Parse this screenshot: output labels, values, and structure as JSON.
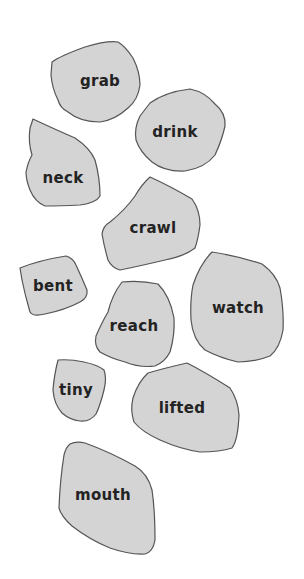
{
  "colors": {
    "background": "#ffffff",
    "shape_fill": "#d4d4d4",
    "shape_outline": "#555555",
    "text": "#232323"
  },
  "words": [
    {
      "label": "grab",
      "x": 100,
      "y": 81
    },
    {
      "label": "drink",
      "x": 175,
      "y": 132
    },
    {
      "label": "neck",
      "x": 63,
      "y": 178
    },
    {
      "label": "crawl",
      "x": 153,
      "y": 228
    },
    {
      "label": "bent",
      "x": 53,
      "y": 286
    },
    {
      "label": "reach",
      "x": 134,
      "y": 326
    },
    {
      "label": "watch",
      "x": 238,
      "y": 308
    },
    {
      "label": "tiny",
      "x": 76,
      "y": 390
    },
    {
      "label": "lifted",
      "x": 182,
      "y": 408
    },
    {
      "label": "mouth",
      "x": 103,
      "y": 495
    }
  ]
}
